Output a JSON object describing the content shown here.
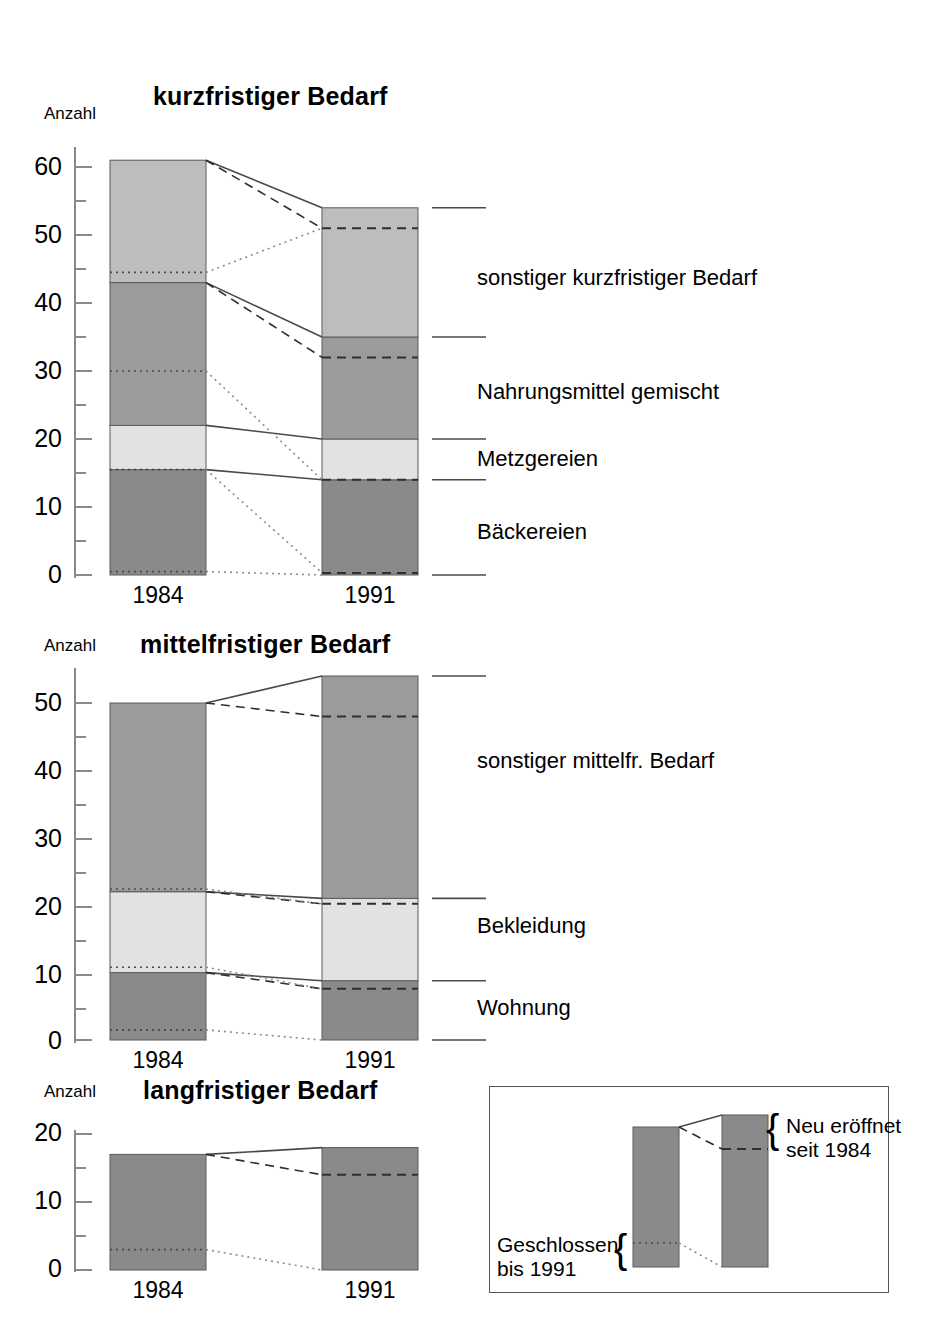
{
  "axis_caption": "Anzahl",
  "categories": [
    "1984",
    "1991"
  ],
  "charts": [
    {
      "title": "kurzfristiger  Bedarf",
      "ylabel": "Anzahl",
      "yticks": [
        0,
        10,
        20,
        30,
        40,
        50,
        60
      ],
      "ylim": [
        0,
        63
      ],
      "xticklabels": [
        "1984",
        "1991"
      ],
      "segments": [
        {
          "name": "Bäckereien",
          "legend": "Bäckereien",
          "color": "#8a8a8a",
          "v1984": 15.5,
          "v1991": 14.0,
          "closed_1984": 0.5,
          "opened_1991": 0.3
        },
        {
          "name": "Metzgereien",
          "legend": "Metzgereien",
          "color": "#e2e2e2",
          "v1984": 22.0,
          "v1991": 20.0,
          "closed_1984": 15.5,
          "opened_1991": 14.0
        },
        {
          "name": "Nahrungsmittel gemischt",
          "legend": "Nahrungsmittel  gemischt",
          "color": "#9b9b9b",
          "v1984": 43.0,
          "v1991": 35.0,
          "closed_1984": 30.0,
          "opened_1991": 32.0
        },
        {
          "name": "sonstiger kurzfristiger Bedarf",
          "legend": "sonstiger  kurzfristiger  Bedarf",
          "color": "#bdbdbd",
          "v1984": 61.0,
          "v1991": 54.0,
          "closed_1984": 44.5,
          "opened_1991": 51.0
        }
      ]
    },
    {
      "title": "mittelfristiger  Bedarf",
      "ylabel": "Anzahl",
      "yticks": [
        0,
        10,
        20,
        30,
        40,
        50
      ],
      "ylim": [
        0,
        56
      ],
      "xticklabels": [
        "1984",
        "1991"
      ],
      "segments": [
        {
          "name": "Wohnung",
          "legend": "Wohnung",
          "color": "#8a8a8a",
          "v1984": 10.0,
          "v1991": 8.8,
          "closed_1984": 1.5,
          "opened_1991": 7.6
        },
        {
          "name": "Bekleidung",
          "legend": "Bekleidung",
          "color": "#e2e2e2",
          "v1984": 22.0,
          "v1991": 21.0,
          "closed_1984": 10.8,
          "opened_1991": 20.2
        },
        {
          "name": "sonstiger mittelfr. Bedarf",
          "legend": "sonstiger  mittelfr.  Bedarf",
          "color": "#9b9b9b",
          "v1984": 50.0,
          "v1991": 54.0,
          "closed_1984": 22.4,
          "opened_1991": 48.0
        }
      ]
    },
    {
      "title": "langfristiger  Bedarf",
      "ylabel": "Anzahl",
      "yticks": [
        0,
        10,
        20
      ],
      "ylim": [
        0,
        20.5
      ],
      "xticklabels": [
        "1984",
        "1991"
      ],
      "segments": [
        {
          "name": "langfristiger Bedarf",
          "legend": "",
          "color": "#8a8a8a",
          "v1984": 17.0,
          "v1991": 18.0,
          "closed_1984": 3.0,
          "opened_1991": 14.0
        }
      ]
    }
  ],
  "key": {
    "new_label_line1": "Neu  eröffnet",
    "new_label_line2": "seit  1984",
    "closed_label_line1": "Geschlossen",
    "closed_label_line2": "bis  1991",
    "brace_glyph": "{"
  },
  "colors": {
    "seg_light": "#e2e2e2",
    "seg_medium_light": "#bdbdbd",
    "seg_medium": "#9b9b9b",
    "seg_dark": "#8a8a8a",
    "line": "#3a3a3a",
    "axis": "#8a8a8a"
  }
}
